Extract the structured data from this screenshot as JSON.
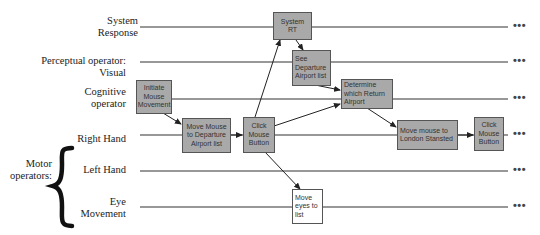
{
  "rows": [
    {
      "label": "System\nResponse",
      "label_lines": [
        "System",
        "Response"
      ],
      "y": 27
    },
    {
      "label_lines": [
        "Perceptual operator:",
        "Visual"
      ],
      "y": 62
    },
    {
      "label_lines": [
        "Cognitive",
        "operator"
      ],
      "y": 99
    },
    {
      "label_lines": [
        "Right Hand"
      ],
      "y": 135
    },
    {
      "label_lines": [
        "Left Hand"
      ],
      "y": 171
    },
    {
      "label_lines": [
        "Eye",
        "Movement"
      ],
      "y": 207
    }
  ],
  "group_label": {
    "lines": [
      "Motor",
      "operators:"
    ]
  },
  "continuation": "•••",
  "boxes": {
    "initiate": {
      "lines": [
        "Initiate",
        "Mouse",
        "Movement"
      ]
    },
    "move_departure": {
      "lines": [
        "Move Mouse",
        "to Departure",
        "Airport list"
      ]
    },
    "click1": {
      "lines": [
        "Click",
        "Mouse",
        "Button"
      ]
    },
    "system_rt": {
      "lines": [
        "System",
        "RT"
      ]
    },
    "see_departure": {
      "lines": [
        "See",
        "Departure",
        "Airport list"
      ]
    },
    "determine": {
      "lines": [
        "Determine",
        "which Return",
        "Airport"
      ]
    },
    "move_stansted": {
      "lines": [
        "Move mouse to",
        "London Stansted"
      ]
    },
    "click2": {
      "lines": [
        "Click",
        "Mouse",
        "Button"
      ]
    },
    "move_eyes": {
      "lines": [
        "Move",
        "eyes to",
        "list"
      ]
    }
  },
  "colors": {
    "box_fill": "#a9a9a9",
    "box_fill_alt": "#ffffff",
    "box_border": "#555555",
    "line": "#333333"
  }
}
